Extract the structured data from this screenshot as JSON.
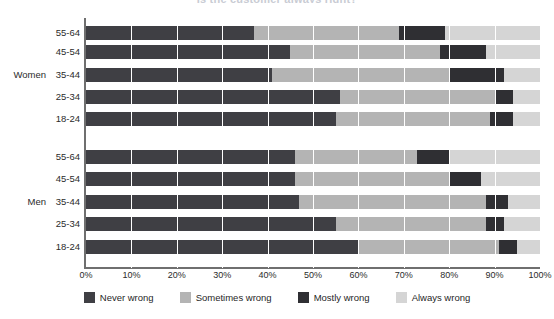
{
  "chart_data": {
    "type": "bar",
    "title": "Is the customer always right?",
    "orientation": "horizontal",
    "stacked": true,
    "stack_mode": "percent",
    "xlabel": "",
    "ylabel": "",
    "xlim": [
      0,
      100
    ],
    "xticks": [
      "0%",
      "10%",
      "20%",
      "30%",
      "40%",
      "50%",
      "60%",
      "70%",
      "80%",
      "90%",
      "100%"
    ],
    "xtick_values": [
      0,
      10,
      20,
      30,
      40,
      50,
      60,
      70,
      80,
      90,
      100
    ],
    "grid": "vertical-white-separators",
    "legend_position": "bottom",
    "legend": [
      "Never wrong",
      "Sometimes wrong",
      "Mostly wrong",
      "Always wrong"
    ],
    "series": [
      {
        "name": "Never wrong",
        "color": "#3f3f44",
        "values": [
          37,
          45,
          41,
          56,
          55,
          46,
          46,
          47,
          55,
          60
        ]
      },
      {
        "name": "Sometimes wrong",
        "color": "#b4b4b4",
        "values": [
          32,
          33,
          39,
          34,
          34,
          27,
          34,
          41,
          33,
          31
        ]
      },
      {
        "name": "Mostly wrong",
        "color": "#2f2f33",
        "values": [
          10,
          10,
          12,
          4,
          5,
          7,
          7,
          5,
          4,
          4
        ]
      },
      {
        "name": "Always wrong",
        "color": "#d5d5d5",
        "values": [
          21,
          12,
          8,
          6,
          6,
          20,
          13,
          7,
          8,
          5
        ]
      }
    ],
    "groups": [
      {
        "label": "Women",
        "categories": [
          "55-64",
          "45-54",
          "35-44",
          "25-34",
          "18-24"
        ]
      },
      {
        "label": "Men",
        "categories": [
          "55-64",
          "45-54",
          "35-44",
          "25-34",
          "18-24"
        ]
      }
    ],
    "categories": [
      "55-64",
      "45-54",
      "35-44",
      "25-34",
      "18-24",
      "55-64",
      "45-54",
      "35-44",
      "25-34",
      "18-24"
    ],
    "rows": [
      {
        "group": "Women",
        "category": "55-64",
        "values": [
          37,
          32,
          10,
          21
        ]
      },
      {
        "group": "Women",
        "category": "45-54",
        "values": [
          45,
          33,
          10,
          12
        ]
      },
      {
        "group": "Women",
        "category": "35-44",
        "values": [
          41,
          39,
          12,
          8
        ]
      },
      {
        "group": "Women",
        "category": "25-34",
        "values": [
          56,
          34,
          4,
          6
        ]
      },
      {
        "group": "Women",
        "category": "18-24",
        "values": [
          55,
          34,
          5,
          6
        ]
      },
      {
        "group": "Men",
        "category": "55-64",
        "values": [
          46,
          27,
          7,
          20
        ]
      },
      {
        "group": "Men",
        "category": "45-54",
        "values": [
          46,
          34,
          7,
          13
        ]
      },
      {
        "group": "Men",
        "category": "35-44",
        "values": [
          47,
          41,
          5,
          7
        ]
      },
      {
        "group": "Men",
        "category": "25-34",
        "values": [
          55,
          33,
          4,
          8
        ]
      },
      {
        "group": "Men",
        "category": "18-24",
        "values": [
          60,
          31,
          4,
          5
        ]
      }
    ]
  },
  "colors": {
    "never_wrong": "#3f3f44",
    "sometimes_wrong": "#b4b4b4",
    "mostly_wrong": "#2f2f33",
    "always_wrong": "#d5d5d5",
    "axis": "#6f6f6f",
    "text": "#2b2b2b",
    "background": "#ffffff"
  }
}
